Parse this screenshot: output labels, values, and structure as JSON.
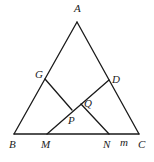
{
  "diagram": {
    "type": "geometry",
    "points": {
      "A": {
        "label": "A",
        "x": 77,
        "y": 22,
        "label_x": 74,
        "label_y": 12
      },
      "B": {
        "label": "B",
        "x": 14,
        "y": 134,
        "label_x": 9,
        "label_y": 148
      },
      "C": {
        "label": "C",
        "x": 139,
        "y": 134,
        "label_x": 138,
        "label_y": 148
      },
      "G": {
        "label": "G",
        "x": 45,
        "y": 79,
        "label_x": 35,
        "label_y": 78
      },
      "D": {
        "label": "D",
        "x": 109,
        "y": 80,
        "label_x": 112,
        "label_y": 83
      },
      "M": {
        "label": "M",
        "x": 47,
        "y": 134,
        "label_x": 41,
        "label_y": 148
      },
      "N": {
        "label": "N",
        "x": 109,
        "y": 134,
        "label_x": 103,
        "label_y": 148
      },
      "P": {
        "label": "P",
        "x": 72,
        "y": 110,
        "label_x": 68,
        "label_y": 124
      },
      "Q": {
        "label": "Q",
        "x": 81,
        "y": 104,
        "label_x": 84,
        "label_y": 107
      }
    },
    "extra_labels": {
      "m": {
        "label": "m",
        "label_x": 120,
        "label_y": 146
      }
    },
    "segments": [
      [
        "A",
        "B"
      ],
      [
        "A",
        "C"
      ],
      [
        "B",
        "C"
      ],
      [
        "G",
        "P"
      ],
      [
        "M",
        "D"
      ],
      [
        "Q",
        "N"
      ]
    ],
    "colors": {
      "line": "#1a1a1a",
      "label": "#222222",
      "background": "#ffffff"
    }
  }
}
